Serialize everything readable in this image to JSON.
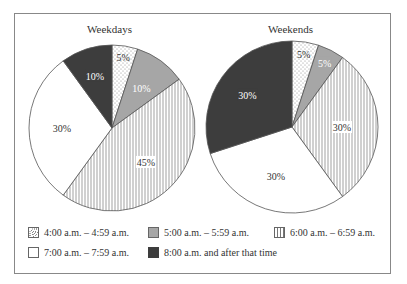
{
  "chart_data": [
    {
      "type": "pie",
      "title": "Weekdays",
      "categories": [
        "4:00 a.m. - 4:59 a.m.",
        "5:00 a.m. - 5:59 a.m.",
        "6:00 a.m. - 6:59 a.m.",
        "7:00 a.m. - 7:59 a.m.",
        "8:00 a.m. and after that time"
      ],
      "values": [
        5,
        10,
        45,
        30,
        10
      ],
      "labels": [
        "5%",
        "10%",
        "45%",
        "30%",
        "10%"
      ]
    },
    {
      "type": "pie",
      "title": "Weekends",
      "categories": [
        "4:00 a.m. - 4:59 a.m.",
        "5:00 a.m. - 5:59 a.m.",
        "6:00 a.m. - 6:59 a.m.",
        "7:00 a.m. - 7:59 a.m.",
        "8:00 a.m. and after that time"
      ],
      "values": [
        5,
        5,
        30,
        30,
        30
      ],
      "labels": [
        "5%",
        "5%",
        "30%",
        "30%",
        "30%"
      ]
    }
  ],
  "titles": {
    "weekdays": "Weekdays",
    "weekends": "Weekends"
  },
  "legend": [
    {
      "label": "4:00 a.m. – 4:59 a.m.",
      "pattern": "dots"
    },
    {
      "label": "5:00 a.m. – 5:59 a.m.",
      "pattern": "gray",
      "color": "#a6a6a6"
    },
    {
      "label": "6:00 a.m. – 6:59 a.m.",
      "pattern": "vertical-lines"
    },
    {
      "label": "7:00 a.m. – 7:59 a.m.",
      "pattern": "white",
      "color": "#ffffff"
    },
    {
      "label": "8:00 a.m. and after that time",
      "pattern": "dark",
      "color": "#3d3d3d"
    }
  ],
  "colors": {
    "gray": "#a6a6a6",
    "dark": "#3d3d3d",
    "line": "#555555"
  }
}
